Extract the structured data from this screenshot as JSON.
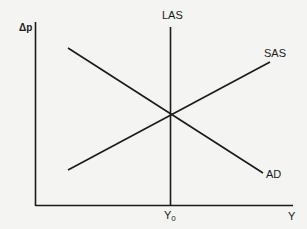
{
  "diagram": {
    "type": "AD-AS model",
    "axes": {
      "y_label": "Δp",
      "x_label": "Y",
      "x_marker_label": "Y",
      "x_marker_subscript": "0"
    },
    "curves": [
      {
        "id": "LAS",
        "label": "LAS",
        "kind": "vertical"
      },
      {
        "id": "SAS",
        "label": "SAS",
        "kind": "upward-sloping"
      },
      {
        "id": "AD",
        "label": "AD",
        "kind": "downward-sloping"
      }
    ],
    "colors": {
      "background": "#f4f4f2",
      "line": "#1a1a1a"
    }
  }
}
